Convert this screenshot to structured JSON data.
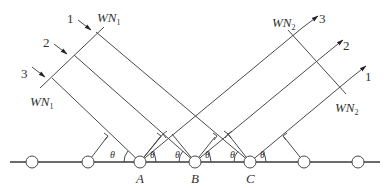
{
  "diagram": {
    "ray_labels_left": [
      "1",
      "2",
      "3"
    ],
    "ray_labels_right": [
      "3",
      "2",
      "1"
    ],
    "wavefront_left": {
      "main": "WN",
      "sub": "1"
    },
    "wavefront_right": {
      "main": "WN",
      "sub": "2"
    },
    "points": [
      "A",
      "B",
      "C"
    ],
    "angle_symbol": "θ",
    "colors": {
      "line": "#4a4a4a",
      "background": "#ffffff"
    }
  }
}
